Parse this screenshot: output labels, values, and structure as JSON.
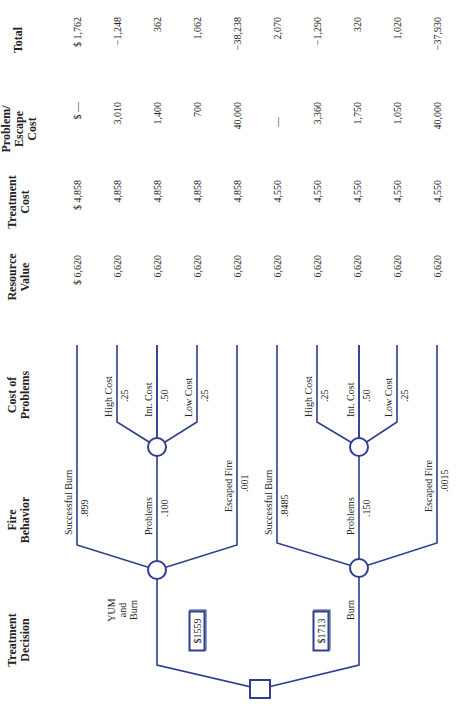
{
  "headers": {
    "treatment_decision": [
      "Treatment",
      "Decision"
    ],
    "fire_behavior": [
      "Fire",
      "Behavior"
    ],
    "cost_of_problems": [
      "Cost of",
      "Problems"
    ],
    "resource_value": [
      "Resource",
      "Value"
    ],
    "treatment_cost": [
      "Treatment",
      "Cost"
    ],
    "problem_escape_cost": [
      "Problem/",
      "Escape",
      "Cost"
    ],
    "total": [
      "Total"
    ]
  },
  "decisions": [
    {
      "label": [
        "YUM",
        "and",
        "Burn"
      ],
      "expected_value": "$1559",
      "fire_behavior": [
        {
          "label": "Successful Burn",
          "prob": ".899"
        },
        {
          "label": "Problems",
          "prob": ".100"
        },
        {
          "label": "Escaped Fire",
          "prob": ".001"
        }
      ],
      "cost_of_problems": [
        {
          "label": "High Cost",
          "prob": ".25"
        },
        {
          "label": "Int. Cost",
          "prob": ".50"
        },
        {
          "label": "Low Cost",
          "prob": ".25"
        }
      ]
    },
    {
      "label": [
        "Burn"
      ],
      "expected_value": "$1713",
      "fire_behavior": [
        {
          "label": "Successful Burn",
          "prob": ".8485"
        },
        {
          "label": "Problems",
          "prob": ".150"
        },
        {
          "label": "Escaped Fire",
          "prob": ".0015"
        }
      ],
      "cost_of_problems": [
        {
          "label": "High Cost",
          "prob": ".25"
        },
        {
          "label": "Int. Cost",
          "prob": ".50"
        },
        {
          "label": "Low Cost",
          "prob": ".25"
        }
      ]
    }
  ],
  "rows": [
    {
      "resource_value": "$ 6,620",
      "treatment_cost": "$ 4,858",
      "problem_escape_cost": "$  —",
      "total": "$ 1,762"
    },
    {
      "resource_value": "6,620",
      "treatment_cost": "4,858",
      "problem_escape_cost": "3,010",
      "total": "−1,248"
    },
    {
      "resource_value": "6,620",
      "treatment_cost": "4,858",
      "problem_escape_cost": "1,400",
      "total": "362"
    },
    {
      "resource_value": "6,620",
      "treatment_cost": "4,858",
      "problem_escape_cost": "700",
      "total": "1,062"
    },
    {
      "resource_value": "6,620",
      "treatment_cost": "4,858",
      "problem_escape_cost": "40,000",
      "total": "−38,238"
    },
    {
      "resource_value": "6,620",
      "treatment_cost": "4,550",
      "problem_escape_cost": "—",
      "total": "2,070"
    },
    {
      "resource_value": "6,620",
      "treatment_cost": "4,550",
      "problem_escape_cost": "3,360",
      "total": "−1,290"
    },
    {
      "resource_value": "6,620",
      "treatment_cost": "4,550",
      "problem_escape_cost": "1,750",
      "total": "320"
    },
    {
      "resource_value": "6,620",
      "treatment_cost": "4,550",
      "problem_escape_cost": "1,050",
      "total": "1,020"
    },
    {
      "resource_value": "6,620",
      "treatment_cost": "4,550",
      "problem_escape_cost": "40,000",
      "total": "−37,930"
    }
  ],
  "colors": {
    "line": "#2e3f8f",
    "text": "#222222"
  }
}
